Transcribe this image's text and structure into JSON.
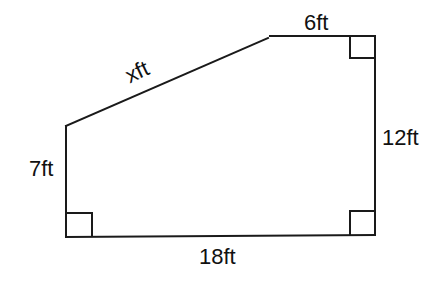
{
  "diagram": {
    "type": "geometry-figure",
    "shape": "right-trapezoid-like pentagon",
    "colors": {
      "stroke": "#1a1a1a",
      "text": "#111111",
      "background": "#ffffff"
    },
    "labels": {
      "top": "6ft",
      "slant": "xft",
      "left": "7ft",
      "right": "12ft",
      "bottom": "18ft"
    },
    "vertices": [
      {
        "name": "A",
        "x": 66,
        "y": 125
      },
      {
        "name": "B",
        "x": 268,
        "y": 38
      },
      {
        "name": "C",
        "x": 375,
        "y": 36
      },
      {
        "name": "D",
        "x": 375,
        "y": 235
      },
      {
        "name": "E",
        "x": 66,
        "y": 237
      }
    ],
    "right_angle_markers": [
      "top-right",
      "bottom-right",
      "bottom-left"
    ]
  }
}
